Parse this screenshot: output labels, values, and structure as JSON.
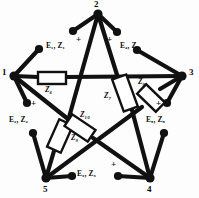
{
  "figure": {
    "type": "circuit-diagram",
    "line_color": "#111111",
    "box_fill": "#ffffff",
    "text_color": "#0b0b0b"
  },
  "nodes": [
    {
      "id": "1",
      "label": "1",
      "x": 14,
      "y": 76
    },
    {
      "id": "2",
      "label": "2",
      "x": 98,
      "y": 14
    },
    {
      "id": "3",
      "label": "3",
      "x": 182,
      "y": 76
    },
    {
      "id": "4",
      "label": "4",
      "x": 150,
      "y": 178
    },
    {
      "id": "5",
      "label": "5",
      "x": 46,
      "y": 178
    }
  ],
  "node_label_positions": [
    {
      "for": "1",
      "x": 2,
      "y": 68
    },
    {
      "for": "2",
      "x": 94,
      "y": 1
    },
    {
      "for": "3",
      "x": 188,
      "y": 68
    },
    {
      "for": "4",
      "x": 146,
      "y": 184
    },
    {
      "for": "5",
      "x": 42,
      "y": 184
    }
  ],
  "sources": [
    {
      "id": "E1",
      "label": "E₁, Z₁",
      "label_x": 47,
      "label_y": 46,
      "polarity": "+",
      "plus_x": 76,
      "plus_y": 40,
      "from_node": "1",
      "to_node": "2"
    },
    {
      "id": "E2",
      "label": "E₂, Z₂",
      "label_x": 12,
      "label_y": 120,
      "polarity": "+",
      "plus_x": 31,
      "plus_y": 105,
      "from_node": "1",
      "to_node": "5"
    },
    {
      "id": "E3",
      "label": "E₃, Z₃",
      "label_x": 78,
      "label_y": 172,
      "polarity": "+",
      "plus_x": 113,
      "plus_y": 163,
      "from_node": "5",
      "to_node": "4"
    },
    {
      "id": "E4",
      "label": "E₄, Z₄",
      "label_x": 122,
      "label_y": 46,
      "polarity": "+",
      "plus_x": 111,
      "plus_y": 40,
      "from_node": "2",
      "to_node": "3"
    },
    {
      "id": "E5",
      "label": "E₅, Z₅",
      "label_x": 146,
      "label_y": 120,
      "polarity": "+",
      "plus_x": 157,
      "plus_y": 105,
      "from_node": "3",
      "to_node": "4"
    }
  ],
  "impedances": [
    {
      "id": "Z6",
      "label": "Z₆",
      "label_x": 47,
      "label_y": 92,
      "on_branch": "1-3",
      "box_cx": 52,
      "box_cy": 78,
      "angle": 0
    },
    {
      "id": "Z7",
      "label": "Z₇",
      "label_x": 110,
      "label_y": 97,
      "on_branch": "2-4",
      "box_cx": 125,
      "box_cy": 93,
      "angle": -20
    },
    {
      "id": "Z8",
      "label": "Z₈",
      "label_x": 140,
      "label_y": 85,
      "on_branch": "3-5",
      "box_cx": 151,
      "box_cy": 98,
      "angle": 44
    },
    {
      "id": "Z9",
      "label": "Z₉",
      "label_x": 73,
      "label_y": 139,
      "on_branch": "2-5",
      "box_cx": 60,
      "box_cy": 136,
      "angle": -66
    },
    {
      "id": "Z10",
      "label": "Z₁₀",
      "label_x": 84,
      "label_y": 117,
      "on_branch": "1-4",
      "box_cx": 80,
      "box_cy": 128,
      "angle": 34
    }
  ],
  "branches": [
    {
      "name": "branch-1-3",
      "kind": "impedance",
      "label": "Z6"
    },
    {
      "name": "branch-2-4",
      "kind": "impedance",
      "label": "Z7"
    },
    {
      "name": "branch-3-5",
      "kind": "impedance",
      "label": "Z8"
    },
    {
      "name": "branch-2-5",
      "kind": "impedance",
      "label": "Z9"
    },
    {
      "name": "branch-1-4",
      "kind": "impedance",
      "label": "Z10"
    },
    {
      "name": "branch-1-2",
      "kind": "source",
      "label": "E1"
    },
    {
      "name": "branch-2-3",
      "kind": "source",
      "label": "E4"
    },
    {
      "name": "branch-3-4",
      "kind": "source",
      "label": "E5"
    },
    {
      "name": "branch-4-5",
      "kind": "source",
      "label": "E3"
    },
    {
      "name": "branch-5-1",
      "kind": "source",
      "label": "E2"
    }
  ]
}
